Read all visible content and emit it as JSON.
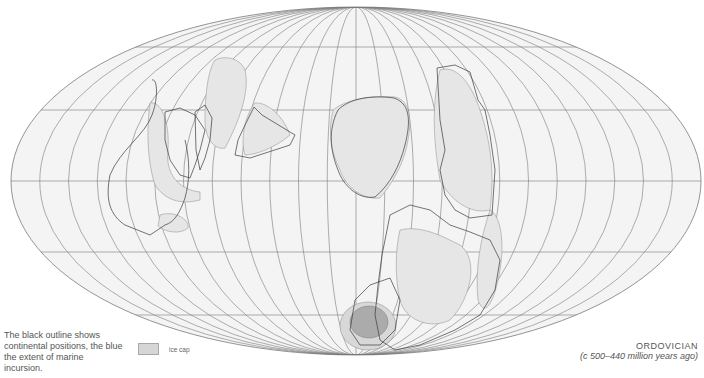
{
  "map": {
    "projection": "mollweide",
    "colors": {
      "background": "#ffffff",
      "ocean_fill": "#f4f4f4",
      "graticule": "#7a7a7a",
      "continent_outline": "#3a3a3a",
      "marine_incursion": "#e6e6e6",
      "ice_cap": "#a8a8a8"
    }
  },
  "caption": "The black outline shows continental positions, the blue the extent of marine incursion.",
  "legend": {
    "items": [
      {
        "label": "ice cap",
        "color": "#d6d6d6"
      }
    ]
  },
  "title": {
    "period": "ORDOVICIAN",
    "range": "(c 500–440 million years ago)"
  }
}
